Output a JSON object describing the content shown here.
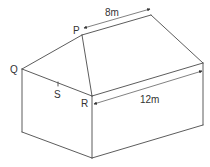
{
  "diagram": {
    "colors": {
      "line": "#4a4a4a",
      "text": "#333333",
      "background": "#ffffff"
    },
    "vertices": {
      "Q": {
        "label": "Q",
        "x": 22,
        "y": 69
      },
      "P": {
        "label": "P",
        "x": 82,
        "y": 35
      },
      "ridge_right": {
        "x": 151,
        "y": 15
      },
      "eave_right": {
        "x": 203,
        "y": 63
      },
      "R": {
        "label": "R",
        "x": 92,
        "y": 96
      },
      "S": {
        "label": "S",
        "x": 58,
        "y": 84
      },
      "base_left": {
        "x": 22,
        "y": 132
      },
      "base_R": {
        "x": 92,
        "y": 158
      },
      "base_right": {
        "x": 203,
        "y": 125
      }
    },
    "labels": {
      "P": "P",
      "Q": "Q",
      "R": "R",
      "S": "S"
    },
    "dimensions": {
      "ridge_length": "8m",
      "eave_length": "12m"
    }
  }
}
